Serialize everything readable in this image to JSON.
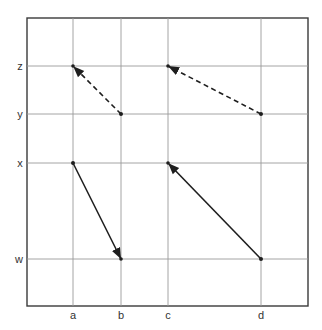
{
  "diagram": {
    "x_axis": {
      "labels": [
        "a",
        "b",
        "c",
        "d"
      ],
      "positions": [
        73,
        121,
        168,
        261
      ]
    },
    "y_axis": {
      "labels": [
        "z",
        "y",
        "x",
        "w"
      ],
      "positions": [
        66,
        114,
        163,
        259
      ]
    },
    "frame": {
      "left": 27,
      "top": 18,
      "right": 308,
      "bottom": 306
    },
    "arrows": [
      {
        "from": [
          "b",
          "y"
        ],
        "to": [
          "a",
          "z"
        ],
        "style": "dashed"
      },
      {
        "from": [
          "d",
          "y"
        ],
        "to": [
          "c",
          "z"
        ],
        "style": "dashed"
      },
      {
        "from": [
          "a",
          "x"
        ],
        "to": [
          "b",
          "w"
        ],
        "style": "solid"
      },
      {
        "from": [
          "d",
          "w"
        ],
        "to": [
          "c",
          "x"
        ],
        "style": "solid"
      }
    ]
  }
}
